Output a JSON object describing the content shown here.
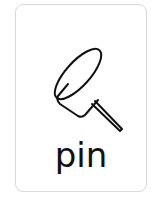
{
  "card": {
    "label": "pin",
    "icon": "pushpin-icon",
    "border_color": "#d9d9d9",
    "stroke_color": "#111111"
  }
}
